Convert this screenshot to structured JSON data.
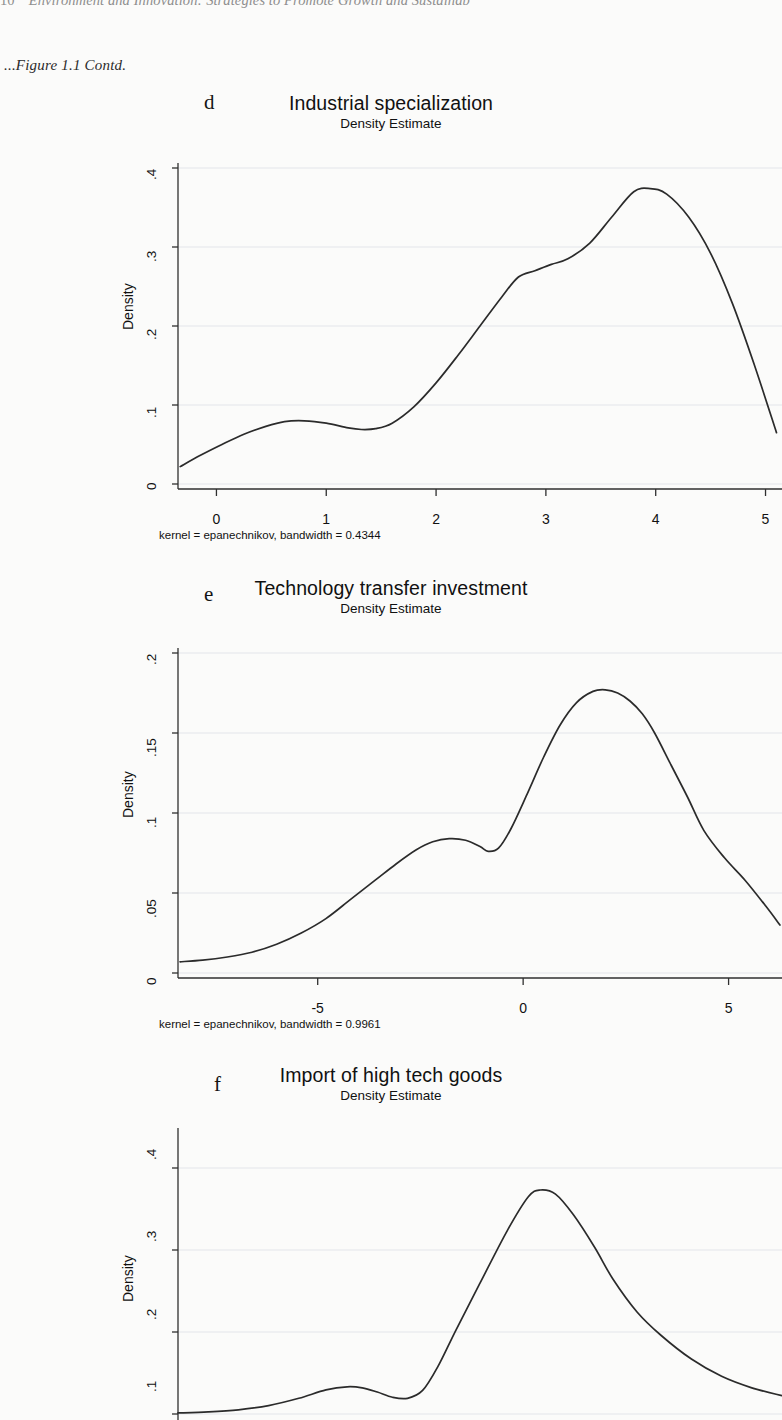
{
  "page": {
    "running_head": "Environment and Innovation: Strategies to Promote Growth and Sustainab",
    "page_number": "10",
    "figure_continuation": "...Figure 1.1 Contd."
  },
  "charts": [
    {
      "letter": "d",
      "title": "Industrial specialization",
      "subtitle": "Density Estimate",
      "ylabel": "Density",
      "kernel_note": "kernel = epanechnikov, bandwidth = 0.4344",
      "yticks": [
        "0",
        ".1",
        ".2",
        ".3",
        ".4"
      ],
      "xticks": [
        "0",
        "1",
        "2",
        "3",
        "4",
        "5"
      ]
    },
    {
      "letter": "e",
      "title": "Technology transfer investment",
      "subtitle": "Density Estimate",
      "ylabel": "Density",
      "kernel_note": "kernel = epanechnikov, bandwidth = 0.9961",
      "yticks": [
        "0",
        ".05",
        ".1",
        ".15",
        ".2"
      ],
      "xticks": [
        "-5",
        "0",
        "5"
      ]
    },
    {
      "letter": "f",
      "title": "Import of high tech goods",
      "subtitle": "Density Estimate",
      "ylabel": "Density",
      "kernel_note": "",
      "yticks": [
        ".1",
        ".2",
        ".3",
        ".4"
      ],
      "xticks": []
    }
  ],
  "chart_data": [
    {
      "type": "line",
      "id": "d",
      "title": "Industrial specialization",
      "subtitle": "Density Estimate",
      "xlabel": "",
      "ylabel": "Density",
      "xlim": [
        -0.35,
        5.15
      ],
      "ylim": [
        0,
        0.4
      ],
      "xticks": [
        0,
        1,
        2,
        3,
        4,
        5
      ],
      "yticks": [
        0,
        0.1,
        0.2,
        0.3,
        0.4
      ],
      "grid": "horizontal",
      "annotation": "kernel = epanechnikov, bandwidth = 0.4344",
      "x": [
        -0.33,
        -0.15,
        0.05,
        0.25,
        0.45,
        0.62,
        0.8,
        1.0,
        1.2,
        1.32,
        1.45,
        1.6,
        1.8,
        2.0,
        2.2,
        2.4,
        2.6,
        2.75,
        2.9,
        3.05,
        3.2,
        3.4,
        3.6,
        3.8,
        3.95,
        4.1,
        4.3,
        4.5,
        4.7,
        4.9,
        5.1
      ],
      "y": [
        0.022,
        0.036,
        0.05,
        0.063,
        0.073,
        0.079,
        0.08,
        0.077,
        0.071,
        0.069,
        0.07,
        0.077,
        0.098,
        0.128,
        0.163,
        0.2,
        0.237,
        0.262,
        0.27,
        0.278,
        0.285,
        0.305,
        0.338,
        0.37,
        0.374,
        0.367,
        0.338,
        0.292,
        0.228,
        0.15,
        0.065
      ]
    },
    {
      "type": "line",
      "id": "e",
      "title": "Technology transfer investment",
      "subtitle": "Density Estimate",
      "xlabel": "",
      "ylabel": "Density",
      "xlim": [
        -8.4,
        6.3
      ],
      "ylim": [
        0,
        0.2
      ],
      "xticks": [
        -5,
        0,
        5
      ],
      "yticks": [
        0,
        0.05,
        0.1,
        0.15,
        0.2
      ],
      "grid": "horizontal",
      "annotation": "kernel = epanechnikov, bandwidth = 0.9961",
      "x": [
        -8.35,
        -7.8,
        -7.2,
        -6.6,
        -6.0,
        -5.4,
        -4.8,
        -4.2,
        -3.6,
        -3.1,
        -2.6,
        -2.2,
        -1.8,
        -1.4,
        -1.05,
        -0.85,
        -0.6,
        -0.3,
        0.1,
        0.5,
        0.9,
        1.3,
        1.7,
        2.0,
        2.3,
        2.6,
        2.9,
        3.2,
        3.6,
        4.0,
        4.4,
        4.9,
        5.4,
        5.9,
        6.25
      ],
      "y": [
        0.007,
        0.008,
        0.01,
        0.013,
        0.018,
        0.025,
        0.034,
        0.046,
        0.058,
        0.068,
        0.077,
        0.082,
        0.084,
        0.083,
        0.079,
        0.076,
        0.078,
        0.09,
        0.112,
        0.135,
        0.155,
        0.169,
        0.176,
        0.177,
        0.175,
        0.17,
        0.162,
        0.15,
        0.13,
        0.11,
        0.089,
        0.072,
        0.058,
        0.042,
        0.03
      ]
    },
    {
      "type": "line",
      "id": "f",
      "title": "Import of high tech goods",
      "subtitle": "Density Estimate",
      "xlabel": "",
      "ylabel": "Density",
      "xlim": [
        0,
        1
      ],
      "ylim": [
        0,
        0.47
      ],
      "xticks": [],
      "yticks": [
        0.1,
        0.2,
        0.3,
        0.4
      ],
      "grid": "horizontal",
      "annotation": "",
      "x": [
        0.0,
        0.05,
        0.1,
        0.15,
        0.2,
        0.245,
        0.28,
        0.305,
        0.33,
        0.355,
        0.38,
        0.405,
        0.43,
        0.46,
        0.5,
        0.545,
        0.58,
        0.6,
        0.625,
        0.655,
        0.69,
        0.72,
        0.76,
        0.8,
        0.85,
        0.9,
        0.95,
        1.0
      ],
      "y": [
        0.002,
        0.004,
        0.008,
        0.016,
        0.03,
        0.046,
        0.052,
        0.05,
        0.042,
        0.032,
        0.03,
        0.045,
        0.09,
        0.16,
        0.25,
        0.35,
        0.415,
        0.428,
        0.42,
        0.38,
        0.318,
        0.258,
        0.195,
        0.15,
        0.105,
        0.072,
        0.05,
        0.035
      ]
    }
  ]
}
